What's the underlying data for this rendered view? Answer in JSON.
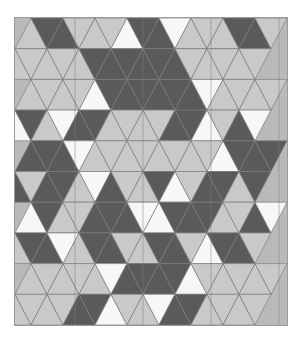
{
  "artwork": {
    "title": "Triangular Tessellation Pattern",
    "type": "geometric-tiling",
    "canvas": {
      "width": 302,
      "height": 343,
      "background": "#ffffff"
    },
    "frame": {
      "x": 14,
      "y": 17,
      "width": 274,
      "height": 309,
      "background": "#b9b9b9",
      "border_color": "#9a9a9a"
    },
    "palette": {
      "dark": "#5a5a5a",
      "light": "#c9c9c9",
      "white": "#f7f7f7",
      "background": "#b9b9b9",
      "stroke": "#7d7d7d",
      "page": "#ffffff"
    },
    "grid": {
      "columns": 16,
      "rows": 10,
      "cell_width": 34.25,
      "cell_height": 30.9,
      "triangles_per_row": 16,
      "note": "Alternating up/down triangles forming a triangular lattice"
    },
    "legend": [
      {
        "swatch": "dark",
        "label": "Dark gray",
        "hex": "#5a5a5a"
      },
      {
        "swatch": "light",
        "label": "Light gray",
        "hex": "#c9c9c9"
      },
      {
        "swatch": "white",
        "label": "White",
        "hex": "#f7f7f7"
      }
    ],
    "tile_rows": [
      [
        "L",
        "D",
        "D",
        "L",
        "L",
        "L",
        "W",
        "D",
        "D",
        "W",
        "L",
        "L",
        "L",
        "D",
        "D",
        "L"
      ],
      [
        "L",
        "L",
        "L",
        "L",
        "L",
        "D",
        "D",
        "D",
        "D",
        "D",
        "D",
        "L",
        "L",
        "L",
        "L",
        "L"
      ],
      [
        "L",
        "L",
        "L",
        "L",
        "W",
        "D",
        "D",
        "D",
        "D",
        "D",
        "D",
        "W",
        "L",
        "L",
        "L",
        "L"
      ],
      [
        "W",
        "D",
        "L",
        "W",
        "D",
        "D",
        "L",
        "L",
        "L",
        "L",
        "D",
        "D",
        "W",
        "L",
        "D",
        "W"
      ],
      [
        "D",
        "D",
        "D",
        "W",
        "L",
        "L",
        "L",
        "L",
        "L",
        "L",
        "L",
        "L",
        "W",
        "D",
        "D",
        "D"
      ],
      [
        "D",
        "L",
        "D",
        "D",
        "L",
        "W",
        "D",
        "L",
        "L",
        "D",
        "W",
        "L",
        "D",
        "D",
        "L",
        "D"
      ],
      [
        "W",
        "D",
        "L",
        "L",
        "D",
        "D",
        "D",
        "W",
        "W",
        "D",
        "D",
        "D",
        "L",
        "L",
        "D",
        "W"
      ],
      [
        "L",
        "D",
        "D",
        "W",
        "L",
        "D",
        "D",
        "L",
        "L",
        "D",
        "D",
        "L",
        "W",
        "D",
        "D",
        "L"
      ],
      [
        "L",
        "L",
        "L",
        "L",
        "L",
        "W",
        "D",
        "D",
        "D",
        "D",
        "W",
        "L",
        "L",
        "L",
        "L",
        "L"
      ],
      [
        "L",
        "L",
        "L",
        "L",
        "D",
        "D",
        "W",
        "L",
        "L",
        "W",
        "D",
        "D",
        "L",
        "L",
        "L",
        "L"
      ]
    ]
  }
}
